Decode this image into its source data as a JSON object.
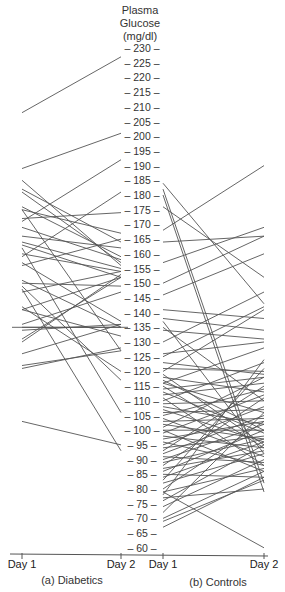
{
  "chart_data": {
    "type": "line",
    "title": "",
    "ylabel": "Plasma Glucose (mg/dl)",
    "axis_title_lines": [
      "Plasma",
      "Glucose",
      "(mg/dl)"
    ],
    "ylim": [
      60,
      230
    ],
    "yticks": [
      230,
      225,
      220,
      215,
      210,
      205,
      200,
      195,
      190,
      185,
      180,
      175,
      170,
      165,
      160,
      155,
      150,
      145,
      140,
      135,
      130,
      125,
      120,
      115,
      110,
      105,
      100,
      95,
      90,
      85,
      80,
      75,
      70,
      65,
      60
    ],
    "grid": false,
    "legend": null,
    "panels": [
      {
        "name": "(a) Diabetics",
        "x": [
          "Day 1",
          "Day 2"
        ],
        "pairs": [
          [
            208,
            227
          ],
          [
            189,
            201
          ],
          [
            185,
            156
          ],
          [
            182,
            164
          ],
          [
            181,
            157
          ],
          [
            176,
            159
          ],
          [
            175,
            167
          ],
          [
            172,
            174
          ],
          [
            171,
            192
          ],
          [
            169,
            158
          ],
          [
            166,
            162
          ],
          [
            164,
            155
          ],
          [
            163,
            152
          ],
          [
            160,
            154
          ],
          [
            159,
            181
          ],
          [
            157,
            137
          ],
          [
            156,
            165
          ],
          [
            151,
            135
          ],
          [
            150,
            149
          ],
          [
            147,
            154
          ],
          [
            141,
            132
          ],
          [
            141,
            152
          ],
          [
            136,
            147
          ],
          [
            135,
            135
          ],
          [
            134,
            136
          ],
          [
            131,
            152
          ],
          [
            130,
            153
          ],
          [
            126,
            136
          ],
          [
            122,
            127
          ],
          [
            121,
            128
          ],
          [
            142,
            120
          ],
          [
            149,
            117
          ],
          [
            175,
            127
          ],
          [
            162,
            106
          ],
          [
            148,
            93
          ],
          [
            103,
            95
          ]
        ]
      },
      {
        "name": "(b) Controls",
        "x": [
          "Day 1",
          "Day 2"
        ],
        "pairs": [
          [
            184,
            143
          ],
          [
            182,
            82
          ],
          [
            180,
            79
          ],
          [
            168,
            190
          ],
          [
            176,
            152
          ],
          [
            164,
            166
          ],
          [
            157,
            169
          ],
          [
            150,
            166
          ],
          [
            146,
            160
          ],
          [
            141,
            138
          ],
          [
            138,
            134
          ],
          [
            137,
            92
          ],
          [
            135,
            110
          ],
          [
            134,
            131
          ],
          [
            130,
            147
          ],
          [
            126,
            130
          ],
          [
            125,
            142
          ],
          [
            123,
            119
          ],
          [
            121,
            120
          ],
          [
            120,
            141
          ],
          [
            119,
            95
          ],
          [
            118,
            113
          ],
          [
            117,
            100
          ],
          [
            116,
            106
          ],
          [
            116,
            128
          ],
          [
            115,
            94
          ],
          [
            114,
            118
          ],
          [
            113,
            99
          ],
          [
            112,
            116
          ],
          [
            111,
            88
          ],
          [
            110,
            123
          ],
          [
            109,
            110
          ],
          [
            108,
            102
          ],
          [
            107,
            96
          ],
          [
            106,
            107
          ],
          [
            105,
            114
          ],
          [
            104,
            91
          ],
          [
            103,
            104
          ],
          [
            102,
            97
          ],
          [
            101,
            118
          ],
          [
            100,
            100
          ],
          [
            100,
            86
          ],
          [
            99,
            112
          ],
          [
            98,
            94
          ],
          [
            97,
            103
          ],
          [
            96,
            88
          ],
          [
            95,
            108
          ],
          [
            94,
            98
          ],
          [
            93,
            115
          ],
          [
            92,
            105
          ],
          [
            91,
            89
          ],
          [
            90,
            102
          ],
          [
            89,
            97
          ],
          [
            88,
            111
          ],
          [
            87,
            93
          ],
          [
            86,
            100
          ],
          [
            85,
            84
          ],
          [
            84,
            96
          ],
          [
            83,
            121
          ],
          [
            82,
            92
          ],
          [
            80,
            103
          ],
          [
            79,
            87
          ],
          [
            78,
            124
          ],
          [
            77,
            80
          ],
          [
            76,
            95
          ],
          [
            74,
            90
          ],
          [
            72,
            106
          ],
          [
            70,
            86
          ],
          [
            69,
            83
          ],
          [
            67,
            84
          ],
          [
            79,
            60
          ]
        ]
      }
    ],
    "x_labels": [
      "Day 1",
      "Day 2",
      "Day 1",
      "Day 2"
    ],
    "group_labels": [
      "(a) Diabetics",
      "(b) Controls"
    ]
  },
  "layout": {
    "y_top_value": 230,
    "y_top_px": 48,
    "px_per_unit": 2.94,
    "diab_x1": 22,
    "diab_x2": 121,
    "ctrl_x1": 163,
    "ctrl_x2": 264,
    "axis_x": 142,
    "baseline_y": 554,
    "line_color": "#555555"
  }
}
